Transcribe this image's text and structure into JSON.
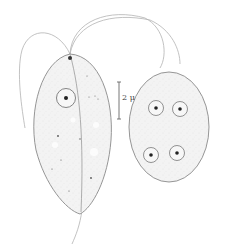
{
  "figure": {
    "scale_bar": {
      "label": "2 μ"
    },
    "colors": {
      "outline": "#8a8a8a",
      "fill": "#f1f1f1",
      "nucleus_dot": "#222222",
      "flagellum": "#b0b0b0"
    },
    "cells": [
      {
        "name": "trophozoite",
        "nuclei": 1,
        "flagella": 3
      },
      {
        "name": "cyst",
        "nuclei": 4
      }
    ]
  }
}
